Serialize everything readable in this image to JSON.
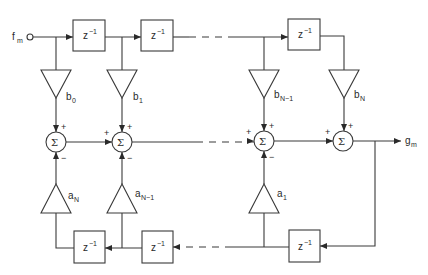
{
  "diagram": {
    "input": {
      "label": "f",
      "sub": "m"
    },
    "output": {
      "label": "g",
      "sub": "m"
    },
    "delay_label": "z",
    "delay_exp": "−1",
    "sum_symbol": "Σ",
    "plus": "+",
    "minus": "−",
    "feedforward_gains": [
      {
        "label": "b",
        "sub": "0"
      },
      {
        "label": "b",
        "sub": "1"
      },
      {
        "label": "b",
        "sub": "N−1"
      },
      {
        "label": "b",
        "sub": "N"
      }
    ],
    "feedback_gains": [
      {
        "label": "a",
        "sub": "N"
      },
      {
        "label": "a",
        "sub": "N−1"
      },
      {
        "label": "a",
        "sub": "1"
      }
    ],
    "colors": {
      "line": "#3a3a3a",
      "text": "#2a2a2a",
      "background": "#ffffff"
    }
  }
}
